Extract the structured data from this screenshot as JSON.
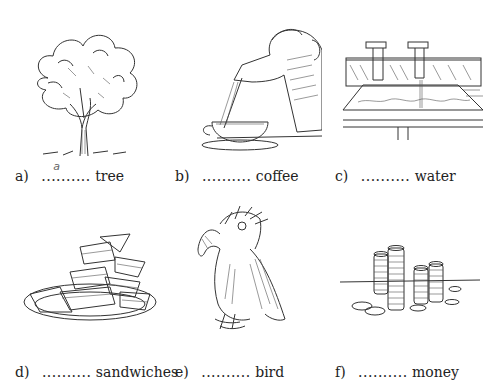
{
  "exercise": {
    "items": [
      {
        "letter": "a)",
        "blank": "..........",
        "answer": "a",
        "noun": "tree",
        "image": "tree-illustration"
      },
      {
        "letter": "b)",
        "blank": "..........",
        "answer": "",
        "noun": "coffee",
        "image": "coffee-pour-illustration"
      },
      {
        "letter": "c)",
        "blank": "..........",
        "answer": "",
        "noun": "water",
        "image": "sink-taps-illustration"
      },
      {
        "letter": "d)",
        "blank": "..........",
        "answer": "",
        "noun": "sandwiches",
        "image": "sandwich-plate-illustration"
      },
      {
        "letter": "e)",
        "blank": "..........",
        "answer": "",
        "noun": "bird",
        "image": "parrot-illustration"
      },
      {
        "letter": "f)",
        "blank": "..........",
        "answer": "",
        "noun": "money",
        "image": "coin-stacks-illustration"
      }
    ]
  }
}
